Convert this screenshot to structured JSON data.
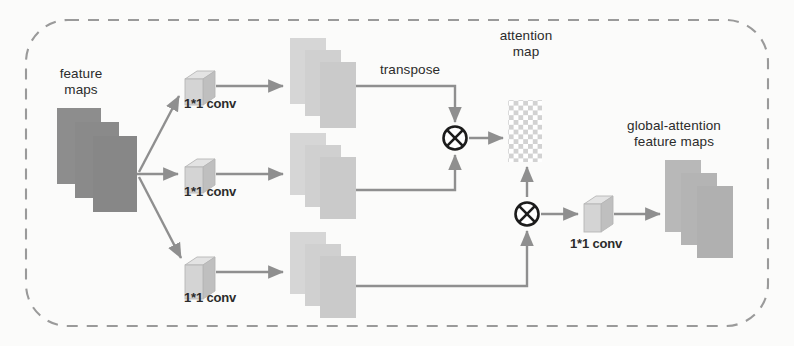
{
  "figure": {
    "type": "architecture-diagram",
    "background_color": "#fbfbfa",
    "border": {
      "style": "dashed",
      "color": "#9a9a9a",
      "corner_radius": 40
    },
    "palette": {
      "input_feature_maps": "#8d8d8d",
      "mid_feature_maps": "#cfcfcf",
      "output_feature_maps": "#b4b4b4",
      "conv_cube_front": "#d2d2d2",
      "conv_cube_top": "#e2e2e2",
      "conv_cube_side": "#bdbdbd",
      "attention_light": "#d4d4d4",
      "attention_dark": "#ffffff",
      "arrow": "#8f8f8f",
      "line": "#8f8f8f",
      "operator": "#1c1c1c",
      "text": "#2b2b2b"
    }
  },
  "labels": {
    "feature_maps": "feature\nmaps",
    "feature_maps_line1": "feature",
    "feature_maps_line2": "maps",
    "conv_top": "1*1 conv",
    "conv_middle": "1*1 conv",
    "conv_bottom": "1*1 conv",
    "conv_output": "1*1 conv",
    "transpose": "transpose",
    "attention_map_line1": "attention",
    "attention_map_line2": "map",
    "global_attention_line1": "global-attention",
    "global_attention_line2": "feature maps"
  },
  "nodes": [
    {
      "id": "input-feature-maps",
      "name": "feature maps",
      "kind": "feature-map-stack",
      "depth": 3,
      "shade": "dark",
      "x": 55,
      "y": 108
    },
    {
      "id": "conv-top",
      "name": "1*1 conv",
      "kind": "conv-cube",
      "x": 183,
      "y": 67
    },
    {
      "id": "conv-middle",
      "name": "1*1 conv",
      "kind": "conv-cube",
      "x": 183,
      "y": 155
    },
    {
      "id": "conv-bottom",
      "name": "1*1 conv",
      "kind": "conv-cube",
      "x": 183,
      "y": 253
    },
    {
      "id": "maps-top",
      "name": "projected feature maps (query)",
      "kind": "feature-map-stack",
      "depth": 3,
      "shade": "light",
      "x": 288,
      "y": 38
    },
    {
      "id": "maps-middle",
      "name": "projected feature maps (key)",
      "kind": "feature-map-stack",
      "depth": 3,
      "shade": "light",
      "x": 288,
      "y": 133
    },
    {
      "id": "maps-bottom",
      "name": "projected feature maps (value)",
      "kind": "feature-map-stack",
      "depth": 3,
      "shade": "light",
      "x": 288,
      "y": 232
    },
    {
      "id": "multiply-1",
      "name": "matrix multiply",
      "kind": "operator",
      "symbol": "circled-times",
      "x": 455,
      "y": 138
    },
    {
      "id": "attention-map",
      "name": "attention map",
      "kind": "checkerboard",
      "cols": 7,
      "rows": 12,
      "x": 508,
      "y": 100
    },
    {
      "id": "multiply-2",
      "name": "matrix multiply",
      "kind": "operator",
      "symbol": "circled-times",
      "x": 527,
      "y": 214
    },
    {
      "id": "conv-out",
      "name": "1*1 conv",
      "kind": "conv-cube",
      "x": 583,
      "y": 200
    },
    {
      "id": "output-feature-maps",
      "name": "global-attention feature maps",
      "kind": "feature-map-stack",
      "depth": 3,
      "shade": "mid",
      "x": 665,
      "y": 160
    }
  ],
  "edges": [
    {
      "from": "input-feature-maps",
      "to": "conv-top",
      "kind": "arrow",
      "routing": "diagonal-up"
    },
    {
      "from": "input-feature-maps",
      "to": "conv-middle",
      "kind": "arrow",
      "routing": "straight"
    },
    {
      "from": "input-feature-maps",
      "to": "conv-bottom",
      "kind": "arrow",
      "routing": "diagonal-down"
    },
    {
      "from": "conv-top",
      "to": "maps-top",
      "kind": "arrow",
      "routing": "straight"
    },
    {
      "from": "conv-middle",
      "to": "maps-middle",
      "kind": "arrow",
      "routing": "straight"
    },
    {
      "from": "conv-bottom",
      "to": "maps-bottom",
      "kind": "arrow",
      "routing": "straight"
    },
    {
      "from": "maps-top",
      "to": "multiply-1",
      "kind": "arrow",
      "label": "transpose",
      "routing": "orthogonal-down"
    },
    {
      "from": "maps-middle",
      "to": "multiply-1",
      "kind": "arrow",
      "routing": "orthogonal-up"
    },
    {
      "from": "multiply-1",
      "to": "attention-map",
      "kind": "arrow",
      "routing": "straight"
    },
    {
      "from": "attention-map",
      "to": "multiply-2",
      "kind": "arrow",
      "routing": "vertical-up"
    },
    {
      "from": "maps-bottom",
      "to": "multiply-2",
      "kind": "arrow",
      "routing": "orthogonal-up"
    },
    {
      "from": "multiply-2",
      "to": "conv-out",
      "kind": "arrow",
      "routing": "straight"
    },
    {
      "from": "conv-out",
      "to": "output-feature-maps",
      "kind": "arrow",
      "routing": "straight"
    }
  ]
}
